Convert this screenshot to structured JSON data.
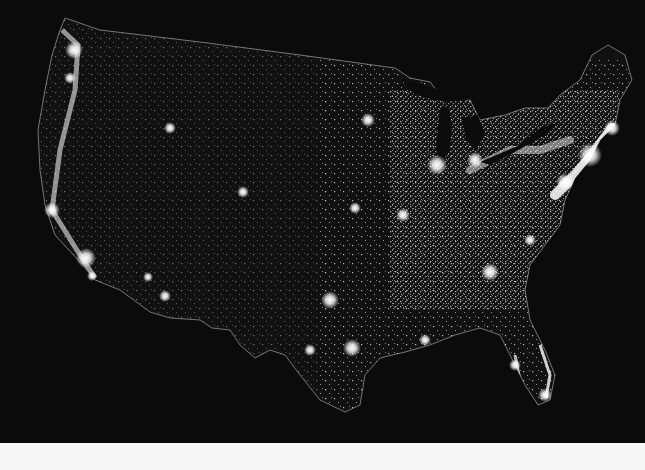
{
  "map": {
    "subject": "Contiguous United States at night (city lights)",
    "background_color": "#0b0b0b",
    "land_outline_color": "#9a9a9a",
    "light_color": "#ffffff",
    "bottom_band_color": "#f7f7f7"
  },
  "light_clusters": [
    {
      "name": "seattle",
      "x": 74,
      "y": 50,
      "r": 9
    },
    {
      "name": "portland",
      "x": 70,
      "y": 78,
      "r": 6
    },
    {
      "name": "bay-area",
      "x": 52,
      "y": 210,
      "r": 8
    },
    {
      "name": "los-angeles",
      "x": 86,
      "y": 258,
      "r": 10
    },
    {
      "name": "san-diego",
      "x": 92,
      "y": 276,
      "r": 5
    },
    {
      "name": "las-vegas",
      "x": 148,
      "y": 277,
      "r": 5
    },
    {
      "name": "phoenix",
      "x": 165,
      "y": 296,
      "r": 6
    },
    {
      "name": "salt-lake",
      "x": 170,
      "y": 128,
      "r": 6
    },
    {
      "name": "denver",
      "x": 243,
      "y": 192,
      "r": 6
    },
    {
      "name": "dallas",
      "x": 330,
      "y": 300,
      "r": 9
    },
    {
      "name": "houston",
      "x": 352,
      "y": 348,
      "r": 9
    },
    {
      "name": "san-antonio",
      "x": 310,
      "y": 350,
      "r": 6
    },
    {
      "name": "minneapolis",
      "x": 368,
      "y": 120,
      "r": 7
    },
    {
      "name": "chicago",
      "x": 437,
      "y": 162,
      "r": 10
    },
    {
      "name": "detroit",
      "x": 475,
      "y": 160,
      "r": 8
    },
    {
      "name": "kansas-city",
      "x": 355,
      "y": 208,
      "r": 6
    },
    {
      "name": "st-louis",
      "x": 403,
      "y": 215,
      "r": 7
    },
    {
      "name": "atlanta",
      "x": 490,
      "y": 272,
      "r": 9
    },
    {
      "name": "new-york",
      "x": 590,
      "y": 155,
      "r": 12
    },
    {
      "name": "boston",
      "x": 612,
      "y": 128,
      "r": 8
    },
    {
      "name": "washington",
      "x": 565,
      "y": 182,
      "r": 9
    },
    {
      "name": "miami",
      "x": 545,
      "y": 395,
      "r": 7
    },
    {
      "name": "tampa",
      "x": 515,
      "y": 365,
      "r": 6
    },
    {
      "name": "new-orleans",
      "x": 425,
      "y": 340,
      "r": 6
    },
    {
      "name": "charlotte",
      "x": 530,
      "y": 240,
      "r": 6
    }
  ]
}
